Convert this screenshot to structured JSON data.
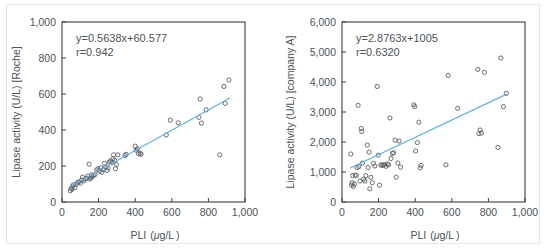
{
  "figure": {
    "background": "#ffffff",
    "frame_color": "#dfe7ea",
    "axis_color": "#3a3f42",
    "marker_color": "#595f63",
    "fit_line_color": "#5fb4e5"
  },
  "chart_data": [
    {
      "type": "scatter",
      "title": "",
      "panel": "left",
      "xlabel": "PLI (μg/L)",
      "xlabel_parts": {
        "name": "PLI",
        "open": "(",
        "mu": "μ",
        "unit": "g/L",
        "close": ")"
      },
      "ylabel": "Lipase activity (U/L) [Roche]",
      "xlim": [
        0,
        1000
      ],
      "ylim": [
        0,
        1000
      ],
      "xticks": [
        0,
        200,
        400,
        600,
        800,
        1000
      ],
      "xtick_labels": [
        "0",
        "200",
        "400",
        "600",
        "800",
        "1,000"
      ],
      "yticks": [
        0,
        200,
        400,
        600,
        800,
        1000
      ],
      "ytick_labels": [
        "0",
        "200",
        "400",
        "600",
        "800",
        "1,000"
      ],
      "grid": false,
      "legend": "none",
      "annotations": [
        "y=0.5638x+60.577",
        "r=0.942"
      ],
      "equation": "y=0.5638x+60.577",
      "slope": 0.5638,
      "intercept": 60.577,
      "correlation": "r=0.942",
      "r_value": 0.942,
      "fit_line": {
        "x": [
          40,
          920
        ],
        "y": [
          83.1,
          579.3
        ]
      },
      "points": [
        [
          45,
          62
        ],
        [
          50,
          75
        ],
        [
          55,
          70
        ],
        [
          58,
          88
        ],
        [
          62,
          95
        ],
        [
          70,
          80
        ],
        [
          78,
          98
        ],
        [
          85,
          108
        ],
        [
          92,
          112
        ],
        [
          100,
          105
        ],
        [
          108,
          122
        ],
        [
          112,
          138
        ],
        [
          120,
          118
        ],
        [
          128,
          128
        ],
        [
          135,
          132
        ],
        [
          142,
          145
        ],
        [
          148,
          210
        ],
        [
          152,
          128
        ],
        [
          158,
          135
        ],
        [
          162,
          150
        ],
        [
          165,
          140
        ],
        [
          172,
          148
        ],
        [
          180,
          152
        ],
        [
          190,
          178
        ],
        [
          196,
          185
        ],
        [
          205,
          172
        ],
        [
          212,
          190
        ],
        [
          218,
          165
        ],
        [
          225,
          180
        ],
        [
          232,
          215
        ],
        [
          240,
          196
        ],
        [
          246,
          175
        ],
        [
          252,
          188
        ],
        [
          258,
          222
        ],
        [
          265,
          228
        ],
        [
          272,
          218
        ],
        [
          278,
          240
        ],
        [
          282,
          262
        ],
        [
          288,
          232
        ],
        [
          292,
          185
        ],
        [
          298,
          208
        ],
        [
          305,
          262
        ],
        [
          345,
          258
        ],
        [
          350,
          265
        ],
        [
          400,
          310
        ],
        [
          405,
          288
        ],
        [
          412,
          295
        ],
        [
          418,
          268
        ],
        [
          428,
          270
        ],
        [
          432,
          265
        ],
        [
          570,
          372
        ],
        [
          592,
          455
        ],
        [
          635,
          440
        ],
        [
          748,
          470
        ],
        [
          755,
          572
        ],
        [
          762,
          438
        ],
        [
          788,
          512
        ],
        [
          862,
          262
        ],
        [
          885,
          642
        ],
        [
          892,
          548
        ],
        [
          912,
          678
        ]
      ]
    },
    {
      "type": "scatter",
      "title": "",
      "panel": "right",
      "xlabel": "PLI (μg/L)",
      "xlabel_parts": {
        "name": "PLI",
        "open": "(",
        "mu": "μ",
        "unit": "g/L",
        "close": ")"
      },
      "ylabel": "Lipase activity (U/L) [company A]",
      "xlim": [
        0,
        1000
      ],
      "ylim": [
        0,
        6000
      ],
      "xticks": [
        0,
        200,
        400,
        600,
        800,
        1000
      ],
      "xtick_labels": [
        "0",
        "200",
        "400",
        "600",
        "800",
        "1,000"
      ],
      "yticks": [
        0,
        1000,
        2000,
        3000,
        4000,
        5000,
        6000
      ],
      "ytick_labels": [
        "0",
        "1,000",
        "2,000",
        "3,000",
        "4,000",
        "5,000",
        "6,000"
      ],
      "grid": false,
      "legend": "none",
      "annotations": [
        "y=2.8763x+1005",
        "r=0.6320"
      ],
      "equation": "y=2.8763x+1005",
      "slope": 2.8763,
      "intercept": 1005,
      "correlation": "r=0.6320",
      "r_value": 0.632,
      "fit_line": {
        "x": [
          45,
          900
        ],
        "y": [
          1134.4,
          3593.7
        ]
      },
      "points": [
        [
          48,
          1600
        ],
        [
          52,
          560
        ],
        [
          55,
          640
        ],
        [
          58,
          880
        ],
        [
          62,
          520
        ],
        [
          68,
          600
        ],
        [
          72,
          900
        ],
        [
          78,
          880
        ],
        [
          82,
          1150
        ],
        [
          88,
          3220
        ],
        [
          92,
          1180
        ],
        [
          98,
          700
        ],
        [
          105,
          2450
        ],
        [
          108,
          2350
        ],
        [
          112,
          1300
        ],
        [
          118,
          760
        ],
        [
          125,
          700
        ],
        [
          130,
          880
        ],
        [
          138,
          1900
        ],
        [
          142,
          1150
        ],
        [
          148,
          1660
        ],
        [
          152,
          440
        ],
        [
          158,
          820
        ],
        [
          165,
          640
        ],
        [
          172,
          1290
        ],
        [
          180,
          1200
        ],
        [
          192,
          3850
        ],
        [
          198,
          1560
        ],
        [
          205,
          560
        ],
        [
          212,
          1240
        ],
        [
          218,
          1220
        ],
        [
          225,
          1230
        ],
        [
          232,
          1250
        ],
        [
          240,
          1190
        ],
        [
          248,
          1270
        ],
        [
          255,
          1240
        ],
        [
          262,
          2800
        ],
        [
          268,
          1450
        ],
        [
          275,
          1620
        ],
        [
          282,
          1640
        ],
        [
          290,
          2060
        ],
        [
          296,
          830
        ],
        [
          305,
          1300
        ],
        [
          312,
          2030
        ],
        [
          320,
          1160
        ],
        [
          392,
          3240
        ],
        [
          398,
          3180
        ],
        [
          402,
          1700
        ],
        [
          412,
          1980
        ],
        [
          420,
          2660
        ],
        [
          428,
          1140
        ],
        [
          432,
          1220
        ],
        [
          568,
          1240
        ],
        [
          580,
          4220
        ],
        [
          632,
          3120
        ],
        [
          742,
          4420
        ],
        [
          748,
          2280
        ],
        [
          755,
          2400
        ],
        [
          762,
          2300
        ],
        [
          778,
          4320
        ],
        [
          852,
          1820
        ],
        [
          868,
          4800
        ],
        [
          882,
          3180
        ],
        [
          898,
          3620
        ]
      ]
    }
  ]
}
